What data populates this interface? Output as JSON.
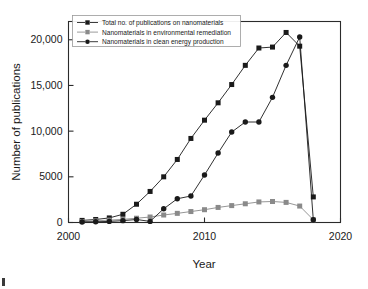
{
  "figure": {
    "background_color": "#ffffff",
    "frame_color": "#2b2b2b"
  },
  "axes": {
    "x": {
      "label": "Year",
      "ticks": [
        "2000",
        "2010",
        "2020"
      ],
      "min": 2000,
      "max": 2020
    },
    "y": {
      "label": "Number of publications",
      "ticks": [
        "0",
        "5000",
        "10,000",
        "15,000",
        "20,000"
      ],
      "min": 0,
      "max": 22000
    }
  },
  "legend": {
    "position": "top-left-inside",
    "entries": [
      {
        "label": "Total no. of publications on nanomaterials",
        "marker": "square",
        "color": "#1a1a1a"
      },
      {
        "label": "Nanomaterials in environmental remediation",
        "marker": "square",
        "color": "#8a8a8a"
      },
      {
        "label": "Nanomaterials in clean energy production",
        "marker": "circle",
        "color": "#1a1a1a"
      }
    ]
  },
  "chart_data": {
    "type": "line",
    "title": "",
    "xlabel": "Year",
    "ylabel": "Number of publications",
    "xlim": [
      2000,
      2020
    ],
    "ylim": [
      0,
      22000
    ],
    "grid": false,
    "legend_position": "upper left",
    "x": [
      2001,
      2002,
      2003,
      2004,
      2005,
      2006,
      2007,
      2008,
      2009,
      2010,
      2011,
      2012,
      2013,
      2014,
      2015,
      2016,
      2017,
      2018
    ],
    "series": [
      {
        "name": "Total no. of publications on nanomaterials",
        "marker": "square",
        "color": "#1a1a1a",
        "values": [
          230,
          330,
          500,
          900,
          2000,
          3400,
          5000,
          6900,
          9200,
          11200,
          13100,
          15100,
          17200,
          19100,
          19200,
          20800,
          19300,
          2800
        ]
      },
      {
        "name": "Nanomaterials in environmental remediation",
        "marker": "square",
        "color": "#8a8a8a",
        "values": [
          110,
          180,
          260,
          340,
          470,
          600,
          820,
          1000,
          1200,
          1400,
          1650,
          1850,
          2050,
          2250,
          2300,
          2200,
          1800,
          300
        ]
      },
      {
        "name": "Nanomaterials in clean energy production",
        "marker": "circle",
        "color": "#1a1a1a",
        "values": [
          60,
          80,
          120,
          200,
          330,
          120,
          1500,
          2600,
          2900,
          5200,
          7600,
          9900,
          11000,
          11000,
          13700,
          17200,
          20300,
          300
        ]
      }
    ]
  }
}
